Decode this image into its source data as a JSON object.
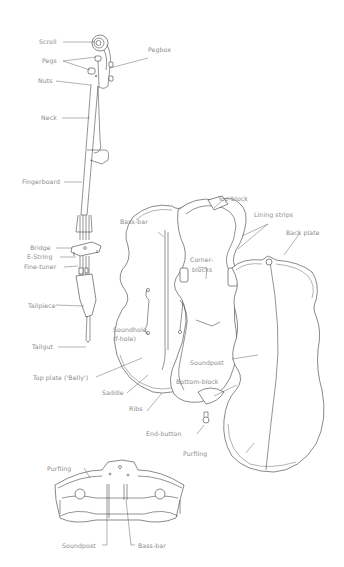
{
  "diagram": {
    "labels": {
      "scroll": "Scroll",
      "pegs": "Pegs",
      "pegbox": "Pegbox",
      "nuts": "Nuts",
      "neck": "Neck",
      "fingerboard": "Fingerboard",
      "bass_bar": "Bass-bar",
      "top_block": "Top-block",
      "lining_strips": "Lining strips",
      "back_plate": "Back plate",
      "corner_blocks_1": "Corner-",
      "corner_blocks_2": "blocks",
      "bridge": "Bridge",
      "e_string": "E-String",
      "fine_tuner": "Fine-tuner",
      "tailpiece": "Tailpiece",
      "soundhole_1": "Soundhole",
      "soundhole_2": "(f-hole)",
      "tailgut": "Tailgut",
      "soundpost": "Soundpost",
      "top_plate": "Top plate ('Belly')",
      "bottom_block": "Bottom-block",
      "saddle": "Saddle",
      "ribs": "Ribs",
      "end_button": "End-button",
      "purfling_right": "Purfling"
    },
    "cross_section": {
      "purfling": "Purfling",
      "soundpost": "Soundpost",
      "bass_bar": "Bass-bar"
    },
    "colors": {
      "line": "#3a3a3a",
      "label": "#8a8a8a",
      "background": "#ffffff"
    }
  }
}
